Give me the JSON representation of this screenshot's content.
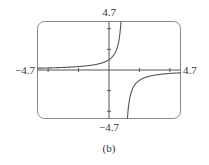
{
  "chart_data": {
    "type": "line",
    "title": "",
    "caption": "(b)",
    "function": "y = 1/(1 - x)",
    "vertical_asymptote": 1,
    "horizontal_asymptote": 0,
    "xlim": [
      -4.7,
      4.7
    ],
    "ylim": [
      -4.7,
      4.7
    ],
    "xlabel": "",
    "ylabel": "",
    "x_tick_values": [
      -4,
      -2,
      2,
      4
    ],
    "y_tick_values": [
      -4,
      -2,
      2,
      4
    ],
    "grid": false,
    "legend": null,
    "window_labels": {
      "xmin": "−4.7",
      "xmax": "4.7",
      "ymin": "−4.7",
      "ymax": "4.7"
    },
    "series": [
      {
        "name": "left branch",
        "x": [
          -4.7,
          -4,
          -3,
          -2,
          -1,
          0,
          0.5,
          0.7,
          0.787
        ],
        "y": [
          0.175,
          0.2,
          0.25,
          0.333,
          0.5,
          1,
          2,
          3.333,
          4.7
        ]
      },
      {
        "name": "right branch",
        "x": [
          1.213,
          1.3,
          1.5,
          2,
          3,
          4,
          4.7
        ],
        "y": [
          -4.7,
          -3.333,
          -2,
          -1,
          -0.5,
          -0.333,
          -0.27
        ]
      }
    ],
    "colors": {
      "curve": "#555555",
      "axes": "#555555",
      "frame": "#777777"
    }
  }
}
